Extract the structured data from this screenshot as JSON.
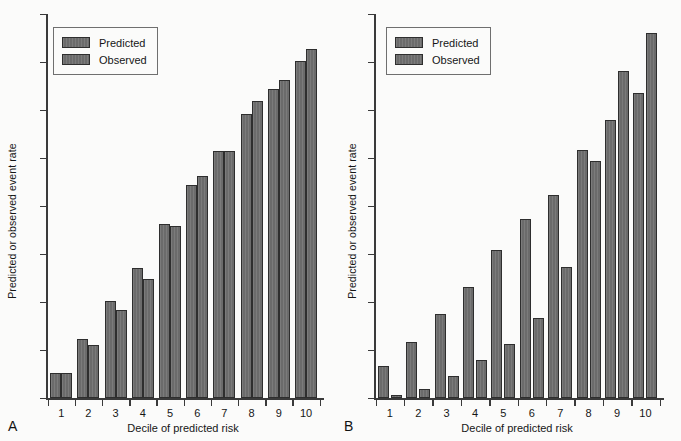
{
  "figure": {
    "background": "#fbfbfa",
    "bar_color": "#6b6b6b",
    "bar_edge_color": "#2e2e2e",
    "axis_color": "#3a3a3a"
  },
  "panels": [
    {
      "letter": "A",
      "legend": {
        "predicted": "Predicted",
        "observed": "Observed"
      },
      "ylabel": "Predicted or observed event rate",
      "xlabel": "Decile of predicted risk"
    },
    {
      "letter": "B",
      "legend": {
        "predicted": "Predicted",
        "observed": "Observed"
      },
      "ylabel": "Predicted or observed event rate",
      "xlabel": "Decile of predicted risk"
    }
  ],
  "chart_data": [
    {
      "type": "bar",
      "panel": "A",
      "title": "",
      "xlabel": "Decile of predicted risk",
      "ylabel": "Predicted or observed event rate",
      "categories": [
        "1",
        "2",
        "3",
        "4",
        "5",
        "6",
        "7",
        "8",
        "9",
        "10"
      ],
      "series": [
        {
          "name": "Predicted",
          "values": [
            6.5,
            15.5,
            25.5,
            34.0,
            45.5,
            55.5,
            64.5,
            74.0,
            80.5,
            88.0
          ]
        },
        {
          "name": "Observed",
          "values": [
            6.5,
            14.0,
            23.0,
            31.0,
            45.0,
            58.0,
            64.5,
            77.5,
            83.0,
            91.0
          ]
        }
      ],
      "ylim": [
        0,
        100
      ],
      "yticks_labeled": false,
      "grid": false,
      "legend_position": "top-left"
    },
    {
      "type": "bar",
      "panel": "B",
      "title": "",
      "xlabel": "Decile of predicted risk",
      "ylabel": "Predicted or observed event rate",
      "categories": [
        "1",
        "2",
        "3",
        "4",
        "5",
        "6",
        "7",
        "8",
        "9",
        "10"
      ],
      "series": [
        {
          "name": "Predicted",
          "values": [
            9.0,
            15.5,
            23.0,
            30.5,
            40.5,
            49.0,
            55.5,
            68.0,
            76.0,
            83.5
          ]
        },
        {
          "name": "Observed",
          "values": [
            1.0,
            2.5,
            6.0,
            10.5,
            15.0,
            22.0,
            36.0,
            65.0,
            89.5,
            100.0
          ]
        }
      ],
      "ylim": [
        0,
        105
      ],
      "yticks_labeled": false,
      "grid": false,
      "legend_position": "top-left"
    }
  ]
}
